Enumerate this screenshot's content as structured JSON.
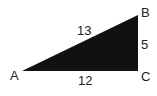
{
  "diagram": {
    "type": "right-triangle",
    "fill_color": "#111111",
    "vertices": {
      "A": {
        "label": "A"
      },
      "B": {
        "label": "B"
      },
      "C": {
        "label": "C"
      }
    },
    "sides": {
      "AB": {
        "label": "13"
      },
      "BC": {
        "label": "5"
      },
      "AC": {
        "label": "12"
      }
    },
    "right_angle_at": "C"
  }
}
